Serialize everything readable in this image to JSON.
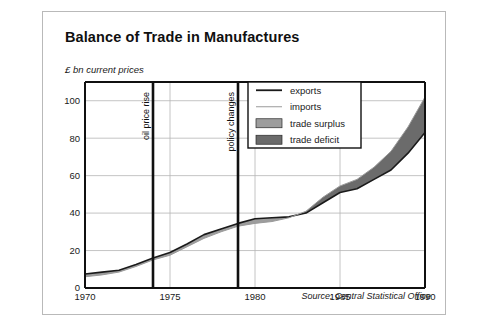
{
  "figure": {
    "title": "Balance of Trade in Manufactures",
    "subtitle": "£ bn current prices",
    "source": "Source: Central Statistical Office"
  },
  "legend": {
    "items": [
      {
        "label": "exports",
        "marker": "thick-dark-line",
        "color": "#1a1a1a"
      },
      {
        "label": "imports",
        "marker": "thin-light-line",
        "color": "#9a9a9a"
      },
      {
        "label": "trade surplus",
        "marker": "filled-swatch",
        "color": "#9d9d9d"
      },
      {
        "label": "trade deficit",
        "marker": "filled-swatch",
        "color": "#6b6b6b"
      }
    ]
  },
  "annotations": [
    {
      "label": "oil price rise",
      "year": 1974
    },
    {
      "label": "policy changes",
      "year": 1979
    }
  ],
  "chart_data": {
    "type": "area",
    "title": "Balance of Trade in Manufactures",
    "subtitle": "£ bn current prices",
    "xlabel": "",
    "ylabel": "£ bn current prices",
    "xlim": [
      1970,
      1990
    ],
    "ylim": [
      0,
      110
    ],
    "yticks": [
      0,
      20,
      40,
      60,
      80,
      100
    ],
    "xticks": [
      1970,
      1975,
      1980,
      1985,
      1990
    ],
    "grid": true,
    "legend_position": "top-right",
    "x": [
      1970,
      1971,
      1972,
      1973,
      1974,
      1975,
      1976,
      1977,
      1978,
      1979,
      1980,
      1981,
      1982,
      1983,
      1984,
      1985,
      1986,
      1987,
      1988,
      1989,
      1990
    ],
    "series": [
      {
        "name": "exports",
        "color": "#1a1a1a",
        "values": [
          7.5,
          8.5,
          9.5,
          12.5,
          16.0,
          19.0,
          23.5,
          28.5,
          31.5,
          34.5,
          37.0,
          37.5,
          38.0,
          40.0,
          45.5,
          51.0,
          53.0,
          58.0,
          63.0,
          72.0,
          83.0
        ]
      },
      {
        "name": "imports",
        "color": "#9a9a9a",
        "values": [
          6.0,
          7.0,
          8.5,
          11.5,
          15.0,
          17.5,
          22.0,
          26.5,
          30.0,
          33.0,
          34.5,
          35.5,
          37.5,
          41.0,
          48.5,
          54.5,
          58.0,
          64.5,
          73.0,
          86.0,
          102.0
        ]
      }
    ],
    "regions": [
      {
        "name": "trade surplus",
        "color": "#9d9d9d",
        "years": [
          1970,
          1983
        ],
        "note": "exports above imports"
      },
      {
        "name": "trade deficit",
        "color": "#6b6b6b",
        "years": [
          1983,
          1990
        ],
        "note": "imports above exports"
      }
    ],
    "annotations": [
      {
        "label": "oil price rise",
        "year": 1974,
        "type": "vline"
      },
      {
        "label": "policy changes",
        "year": 1979,
        "type": "vline"
      }
    ]
  }
}
